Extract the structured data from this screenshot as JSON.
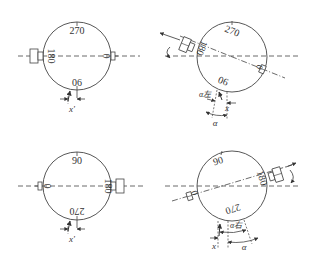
{
  "panels": [
    {
      "id": "top-left",
      "labels": {
        "top": "270",
        "bottom": "06",
        "left": "180",
        "right": "0"
      },
      "offset_label": "x'"
    },
    {
      "id": "top-right",
      "labels": {
        "top": "270",
        "bottom": "06",
        "left": "180",
        "right": "0"
      },
      "offset_label": "x",
      "angle_label": "α",
      "sub_angle_label": "α左"
    },
    {
      "id": "bottom-left",
      "labels": {
        "top": "90",
        "bottom": "270",
        "left": "0",
        "right": "180"
      },
      "offset_label": "x'"
    },
    {
      "id": "bottom-right",
      "labels": {
        "top": "90",
        "bottom": "270",
        "left": "0",
        "right": "180"
      },
      "offset_label": "x",
      "angle_label": "α",
      "sub_angle_label": "α右"
    }
  ],
  "colors": {
    "stroke": "#444444",
    "background": "#ffffff"
  }
}
